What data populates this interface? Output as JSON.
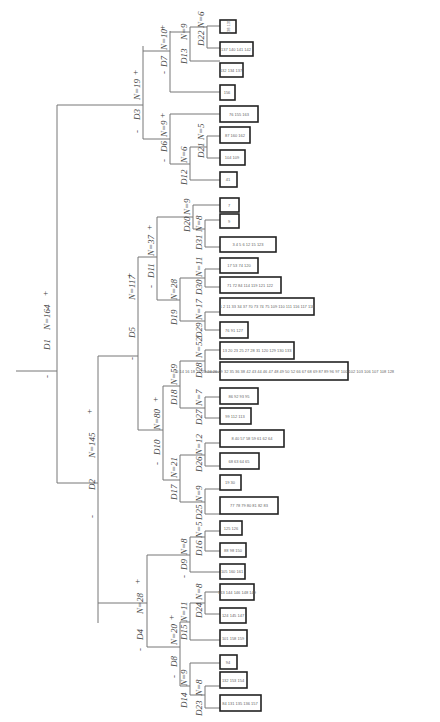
{
  "diagram": {
    "type": "decision-tree",
    "orientation": "rotated-90",
    "root": {
      "split": "D1",
      "n": 164,
      "minus": {
        "split": "D2",
        "n": 145,
        "minus": {
          "split": "D4",
          "n": 28,
          "minus": {
            "split": "D8",
            "n": 20,
            "minus": {
              "split": "D14",
              "n": 9,
              "minus": {
                "split": "D23",
                "n": 8,
                "minus": {
                  "leaf": "84 131 135 136 157"
                },
                "plus": {
                  "leaf": "132 153 154"
                }
              },
              "plus": {
                "leaf": "94"
              }
            },
            "plus": {
              "split": "D15",
              "n": 11,
              "minus": {
                "leaf": "101 158 159"
              },
              "plus": {
                "split": "D24",
                "n": 8,
                "minus": {
                  "leaf": "124 145 147"
                },
                "plus": {
                  "leaf": "143 144 146 148 149"
                }
              }
            }
          },
          "plus": {
            "split": "D9",
            "n": 8,
            "minus": {
              "leaf": "105 160 161"
            },
            "plus": {
              "split": "D16",
              "n": 5,
              "minus": {
                "leaf": "88 98 150"
              },
              "plus": {
                "leaf": "125 126"
              }
            }
          }
        },
        "plus": {
          "split": "D5",
          "n": 117,
          "minus": {
            "split": "D10",
            "n": 80,
            "minus": {
              "split": "D17",
              "n": 21,
              "minus": {
                "split": "D25",
                "n": 9,
                "minus": {
                  "leaf": "77 78 79 80 81 82 83"
                },
                "plus": {
                  "leaf": "19 30"
                }
              },
              "plus": {
                "split": "D26",
                "n": 12,
                "minus": {
                  "leaf": "68 63 64 65"
                },
                "plus": {
                  "leaf": "8 40 57 58 59 61 62 64"
                }
              }
            },
            "plus": {
              "split": "D18",
              "n": 59,
              "minus": {
                "split": "D27",
                "n": 7,
                "minus": {
                  "leaf": "99 112 113"
                },
                "plus": {
                  "leaf": "86 92 93 95"
                }
              },
              "plus": {
                "split": "D28",
                "n": 52,
                "minus": {
                  "leaf": "10 14 16 18 21 22 24 26 29 32 35 36 38 42 43 44 46 47 48 49 50 52 66 67 68 69 87 89 96 97 100 102 103 106 107 108 128"
                },
                "plus": {
                  "leaf": "13 20 23 25 27 28 31 120 129 130 133"
                }
              }
            }
          },
          "plus": {
            "split": "D11",
            "n": 37,
            "minus": {
              "split": "D19",
              "n": 28,
              "minus": {
                "split": "D29",
                "n": 17,
                "minus": {
                  "leaf": "76 91 127"
                },
                "plus": {
                  "leaf": "1 2 11 33 34 37 70 73 74 75 109 110 111 116 117 118"
                }
              },
              "plus": {
                "split": "D30",
                "n": 11,
                "minus": {
                  "leaf": "71 72 84 114 119 121 122"
                },
                "plus": {
                  "leaf": "17 53 74 120"
                }
              }
            },
            "plus": {
              "split": "D20",
              "n": 9,
              "minus": {
                "split": "D31",
                "n": 8,
                "minus": {
                  "leaf": "3 4 5 6 12 15 123"
                },
                "plus": {
                  "leaf": "9"
                }
              },
              "plus": {
                "leaf": "7"
              }
            }
          }
        }
      },
      "plus": {
        "split": "D3",
        "n": 19,
        "minus": {
          "split": "D6",
          "n": 9,
          "minus": {
            "split": "D12",
            "n": 6,
            "minus": {
              "leaf": "41"
            },
            "plus": {
              "split": "D21",
              "n": 5,
              "minus": {
                "leaf": "104 109"
              },
              "plus": {
                "leaf": "87 160 162"
              }
            }
          },
          "plus": {
            "leaf": "76 155 163"
          }
        },
        "plus": {
          "split": "D7",
          "n": 10,
          "minus": {
            "leaf": "156"
          },
          "plus": {
            "split": "D13",
            "n": 9,
            "minus": {
              "leaf": "132 134 137"
            },
            "plus": {
              "split": "D22",
              "n": 6,
              "minus": {
                "leaf": "137 140 141 142"
              },
              "plus": {
                "leaf": "138 139"
              }
            }
          }
        }
      }
    },
    "labels": {
      "minus": "-",
      "plus": "+",
      "nodes": [
        {
          "id": "D1",
          "n": "N=164"
        },
        {
          "id": "D2",
          "n": "N=145"
        },
        {
          "id": "D3",
          "n": "N=19"
        },
        {
          "id": "D4",
          "n": "N=28"
        },
        {
          "id": "D5",
          "n": "N=117"
        },
        {
          "id": "D6",
          "n": "N=9"
        },
        {
          "id": "D7",
          "n": "N=10"
        },
        {
          "id": "D8",
          "n": "N=20"
        },
        {
          "id": "D9",
          "n": "N=8"
        },
        {
          "id": "D10",
          "n": "N=80"
        },
        {
          "id": "D11",
          "n": "N=37"
        },
        {
          "id": "D12",
          "n": "N=6"
        },
        {
          "id": "D13",
          "n": "N=9"
        },
        {
          "id": "D14",
          "n": "N=9"
        },
        {
          "id": "D15",
          "n": "N=11"
        },
        {
          "id": "D16",
          "n": "N=5"
        },
        {
          "id": "D17",
          "n": "N=21"
        },
        {
          "id": "D18",
          "n": "N=59"
        },
        {
          "id": "D19",
          "n": "N=28"
        },
        {
          "id": "D20",
          "n": "N=9"
        },
        {
          "id": "D21",
          "n": "N=5"
        },
        {
          "id": "D22",
          "n": "N=6"
        },
        {
          "id": "D23",
          "n": "N=8"
        },
        {
          "id": "D24",
          "n": "N=8"
        },
        {
          "id": "D25",
          "n": "N=9"
        },
        {
          "id": "D26",
          "n": "N=12"
        },
        {
          "id": "D27",
          "n": "N=7"
        },
        {
          "id": "D28",
          "n": "N=52"
        },
        {
          "id": "D29",
          "n": "N=17"
        },
        {
          "id": "D30",
          "n": "N=11"
        },
        {
          "id": "D31",
          "n": "N=8"
        }
      ]
    },
    "leaves": [
      "138 139",
      "137 140 141 142",
      "132 134 137",
      "156",
      "76 155 163",
      "87 160 162",
      "104 109",
      "41",
      "7",
      "9",
      "3 4 5 6 12 15 123",
      "17 53 74 120",
      "71 72 84 114 119 121 122",
      "1 2 11 33 34 37 70 73 74 75 109 110 111 116 117 118",
      "76 91 127",
      "13 20 23 25 27 28 31 120 129 130 133",
      "10 14 16 18 21 22 24 26 29 32 35 36 38 42 43 44 46 47 48 49 50 52 66 67 68 69 87 89 96 97 100 102 103 106 107 108 128",
      "86 92 93 95",
      "99 112 113",
      "8 40 57 58 59 61 62 64",
      "68 63 64 65",
      "19 30",
      "77 78 79 80 81 82 83",
      "125 126",
      "88 98 150",
      "105 160 161",
      "143 144 146 148 149",
      "124 145 147",
      "101 158 159",
      "94",
      "132 153 154",
      "84 131 135 136 157"
    ]
  }
}
